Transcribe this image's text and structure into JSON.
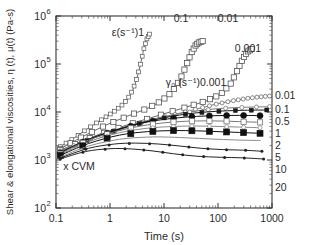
{
  "chart_data": {
    "type": "line",
    "title": "",
    "xlabel": "Time (s)",
    "ylabel": "Shear & elongational viscosities, η (t), μ(t) (Pa-s)",
    "xscale": "log",
    "yscale": "log",
    "xlim": [
      0.1,
      1000
    ],
    "ylim": [
      100,
      1000000
    ],
    "xticks": [
      "0.1",
      "1",
      "10",
      "100",
      "1000"
    ],
    "yticks": [
      "10",
      "10",
      "10",
      "10",
      "10"
    ],
    "ytick_exponents": [
      "2",
      "3",
      "4",
      "5",
      "6"
    ],
    "grid": false,
    "annotations": [
      {
        "name": "elongational-legend",
        "text": "ε(s⁻¹)1",
        "x": 128,
        "y": 36
      },
      {
        "name": "elongational-rate-0.1",
        "text": "0.1",
        "x": 181,
        "y": 22
      },
      {
        "name": "elongational-rate-0.01",
        "text": "0.01",
        "x": 228,
        "y": 22
      },
      {
        "name": "elongational-rate-0.001",
        "text": "0.001",
        "x": 248,
        "y": 52
      },
      {
        "name": "shear-legend",
        "text": "γ₀ (s⁻¹)0.001",
        "x": 196,
        "y": 86
      },
      {
        "name": "cvm-marker",
        "text": "x CVM",
        "x": 79,
        "y": 170
      }
    ],
    "right_labels": [
      {
        "text": "0.01",
        "y": 99
      },
      {
        "text": "0.1",
        "y": 113
      },
      {
        "text": "0.5",
        "y": 125
      },
      {
        "text": "1",
        "y": 137
      },
      {
        "text": "2",
        "y": 149
      },
      {
        "text": "5",
        "y": 161
      },
      {
        "text": "10",
        "y": 173
      },
      {
        "text": "20",
        "y": 191
      }
    ],
    "series": [
      {
        "name": "elongational-1",
        "kind": "elongational",
        "rate": "1",
        "marker": "open-square-small",
        "color": "#555555",
        "points": [
          [
            0.12,
            1900
          ],
          [
            0.2,
            2700
          ],
          [
            0.35,
            4200
          ],
          [
            0.6,
            6200
          ],
          [
            0.9,
            8300
          ],
          [
            1.3,
            11000
          ],
          [
            1.8,
            15000
          ],
          [
            2.4,
            23000
          ],
          [
            3.0,
            42000
          ],
          [
            3.6,
            90000
          ],
          [
            4.2,
            200000
          ],
          [
            4.8,
            330000
          ],
          [
            5.4,
            420000
          ]
        ]
      },
      {
        "name": "elongational-0.1",
        "kind": "elongational",
        "rate": "0.1",
        "marker": "open-square",
        "color": "#555555",
        "points": [
          [
            0.12,
            1700
          ],
          [
            0.3,
            3000
          ],
          [
            0.8,
            5200
          ],
          [
            2,
            8000
          ],
          [
            5,
            12000
          ],
          [
            9,
            17000
          ],
          [
            14,
            26000
          ],
          [
            20,
            48000
          ],
          [
            26,
            95000
          ],
          [
            32,
            170000
          ],
          [
            38,
            240000
          ],
          [
            44,
            280000
          ],
          [
            52,
            300000
          ]
        ]
      },
      {
        "name": "elongational-0.01",
        "kind": "elongational",
        "rate": "0.01",
        "marker": "open-square",
        "color": "#555555",
        "points": [
          [
            0.12,
            1600
          ],
          [
            0.5,
            3100
          ],
          [
            2,
            5300
          ],
          [
            8,
            8500
          ],
          [
            25,
            12500
          ],
          [
            60,
            17000
          ],
          [
            110,
            23000
          ],
          [
            170,
            38000
          ],
          [
            230,
            75000
          ],
          [
            290,
            130000
          ],
          [
            350,
            180000
          ],
          [
            420,
            205000
          ]
        ]
      },
      {
        "name": "elongational-0.001",
        "kind": "elongational",
        "rate": "0.001",
        "marker": "open-circle-small",
        "color": "#6a6a6a",
        "points": [
          [
            0.12,
            1550
          ],
          [
            0.6,
            3100
          ],
          [
            3,
            5400
          ],
          [
            12,
            8200
          ],
          [
            40,
            11500
          ],
          [
            90,
            14500
          ],
          [
            180,
            17000
          ],
          [
            320,
            19000
          ],
          [
            550,
            20500
          ],
          [
            900,
            21500
          ]
        ]
      },
      {
        "name": "shear-0.001",
        "kind": "shear",
        "rate": "0.001",
        "marker": "open-circle-small",
        "color": "#7a7a7a",
        "points": [
          [
            0.12,
            1500
          ],
          [
            0.5,
            3000
          ],
          [
            2,
            5000
          ],
          [
            8,
            7600
          ],
          [
            30,
            10000
          ],
          [
            80,
            11500
          ],
          [
            200,
            12300
          ],
          [
            450,
            12700
          ],
          [
            900,
            12900
          ]
        ]
      },
      {
        "name": "shear-0.01",
        "kind": "shear",
        "rate": "0.01",
        "marker": "filled-square-small",
        "color": "#1a1a1a",
        "points": [
          [
            0.12,
            1450
          ],
          [
            0.5,
            2900
          ],
          [
            2,
            4900
          ],
          [
            8,
            7200
          ],
          [
            25,
            9000
          ],
          [
            60,
            10000
          ],
          [
            150,
            10600
          ],
          [
            350,
            10900
          ],
          [
            800,
            11000
          ]
        ]
      },
      {
        "name": "shear-0.1",
        "kind": "shear",
        "rate": "0.1",
        "marker": "filled-circle",
        "color": "#111111",
        "points": [
          [
            0.12,
            1400
          ],
          [
            0.4,
            2700
          ],
          [
            1.5,
            4400
          ],
          [
            5,
            6200
          ],
          [
            15,
            7400
          ],
          [
            40,
            8100
          ],
          [
            100,
            8400
          ],
          [
            250,
            8500
          ],
          [
            600,
            8400
          ]
        ]
      },
      {
        "name": "shear-0.5",
        "kind": "shear",
        "rate": "0.5",
        "marker": "open-square",
        "color": "#777777",
        "points": [
          [
            0.12,
            1350
          ],
          [
            0.4,
            2600
          ],
          [
            1.5,
            4100
          ],
          [
            5,
            5400
          ],
          [
            15,
            6200
          ],
          [
            40,
            6500
          ],
          [
            100,
            6500
          ],
          [
            250,
            6300
          ],
          [
            600,
            6100
          ]
        ]
      },
      {
        "name": "shear-1",
        "kind": "shear",
        "rate": "1",
        "marker": "open-circle-small",
        "color": "#8a8a8a",
        "points": [
          [
            0.12,
            1300
          ],
          [
            0.4,
            2400
          ],
          [
            1.5,
            3700
          ],
          [
            5,
            4600
          ],
          [
            15,
            5000
          ],
          [
            40,
            5100
          ],
          [
            100,
            5000
          ],
          [
            250,
            4850
          ],
          [
            600,
            4700
          ]
        ]
      },
      {
        "name": "shear-2",
        "kind": "shear",
        "rate": "2",
        "marker": "filled-square",
        "color": "#111111",
        "points": [
          [
            0.12,
            1250
          ],
          [
            0.4,
            2200
          ],
          [
            1.5,
            3300
          ],
          [
            5,
            3900
          ],
          [
            15,
            4100
          ],
          [
            40,
            4050
          ],
          [
            100,
            3900
          ],
          [
            250,
            3750
          ],
          [
            600,
            3600
          ]
        ]
      },
      {
        "name": "shear-5",
        "kind": "shear",
        "rate": "5",
        "marker": "none",
        "color": "#8a8a8a",
        "points": [
          [
            0.12,
            1150
          ],
          [
            0.4,
            1950
          ],
          [
            1.5,
            2700
          ],
          [
            5,
            3000
          ],
          [
            12,
            3000
          ],
          [
            35,
            2850
          ],
          [
            100,
            2700
          ],
          [
            250,
            2600
          ],
          [
            600,
            2550
          ]
        ]
      },
      {
        "name": "shear-10",
        "kind": "shear",
        "rate": "10",
        "marker": "filled-dot",
        "color": "#222222",
        "points": [
          [
            0.12,
            1100
          ],
          [
            0.4,
            1750
          ],
          [
            1.2,
            2150
          ],
          [
            3,
            2250
          ],
          [
            8,
            2150
          ],
          [
            20,
            1950
          ],
          [
            50,
            1750
          ],
          [
            120,
            1650
          ],
          [
            300,
            1600
          ],
          [
            650,
            1520
          ]
        ]
      },
      {
        "name": "shear-20",
        "kind": "shear",
        "rate": "20",
        "marker": "filled-dot",
        "color": "#222222",
        "points": [
          [
            0.12,
            1050
          ],
          [
            0.35,
            1500
          ],
          [
            1,
            1720
          ],
          [
            2.5,
            1700
          ],
          [
            6,
            1550
          ],
          [
            15,
            1350
          ],
          [
            40,
            1200
          ],
          [
            110,
            1140
          ],
          [
            280,
            1110
          ],
          [
            700,
            1050
          ]
        ]
      }
    ]
  }
}
